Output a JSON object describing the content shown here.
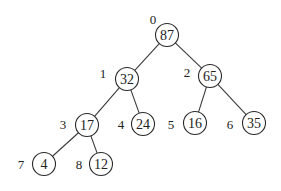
{
  "diagram": {
    "type": "binary-heap-tree",
    "radius": 11.5,
    "nodes": [
      {
        "index": "0",
        "value": "87",
        "cx": 167,
        "cy": 35,
        "lx": 153,
        "ly": 19
      },
      {
        "index": "1",
        "value": "32",
        "cx": 127,
        "cy": 79,
        "lx": 103,
        "ly": 73
      },
      {
        "index": "2",
        "value": "65",
        "cx": 210,
        "cy": 76,
        "lx": 187,
        "ly": 72
      },
      {
        "index": "3",
        "value": "17",
        "cx": 87,
        "cy": 125,
        "lx": 63,
        "ly": 124
      },
      {
        "index": "4",
        "value": "24",
        "cx": 143,
        "cy": 124,
        "lx": 121,
        "ly": 124
      },
      {
        "index": "5",
        "value": "16",
        "cx": 195,
        "cy": 123,
        "lx": 171,
        "ly": 124
      },
      {
        "index": "6",
        "value": "35",
        "cx": 254,
        "cy": 123,
        "lx": 230,
        "ly": 124
      },
      {
        "index": "7",
        "value": "4",
        "cx": 44,
        "cy": 164,
        "lx": 21,
        "ly": 164
      },
      {
        "index": "8",
        "value": "12",
        "cx": 101,
        "cy": 164,
        "lx": 79,
        "ly": 164
      }
    ],
    "edges": [
      [
        0,
        1
      ],
      [
        0,
        2
      ],
      [
        1,
        3
      ],
      [
        1,
        4
      ],
      [
        2,
        5
      ],
      [
        2,
        6
      ],
      [
        3,
        7
      ],
      [
        3,
        8
      ]
    ]
  }
}
